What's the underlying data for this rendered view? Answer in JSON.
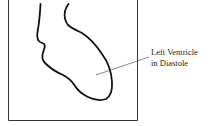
{
  "diagram": {
    "label": {
      "line1": "Left Ventricle",
      "line2": "in Diastole"
    },
    "colors": {
      "outline": "#111111",
      "frame": "#333333",
      "pointer": "#555555",
      "background": "#ffffff"
    }
  }
}
